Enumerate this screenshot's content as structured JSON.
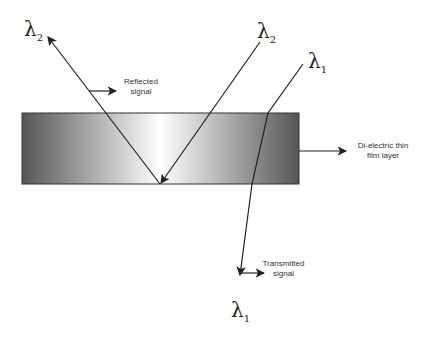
{
  "diagram": {
    "labels": {
      "lambda2_reflected": {
        "symbol": "λ",
        "sub": "2"
      },
      "lambda2_incident": {
        "symbol": "λ",
        "sub": "2"
      },
      "lambda1_incident": {
        "symbol": "λ",
        "sub": "1"
      },
      "lambda1_transmitted": {
        "symbol": "λ",
        "sub": "1"
      },
      "reflected": [
        "Reflected",
        "signal"
      ],
      "film": [
        "Di-electric thin",
        "film layer"
      ],
      "transmitted": [
        "Transmitted",
        "signal"
      ]
    },
    "colors": {
      "film_edge": "#555555",
      "film_center": "#ffffff",
      "line": "#222222"
    }
  }
}
